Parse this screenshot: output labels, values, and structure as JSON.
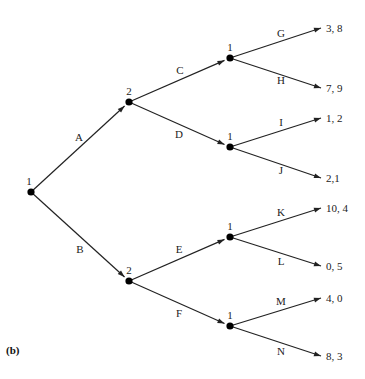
{
  "caption": "(b)",
  "nodes": [
    {
      "id": "root",
      "player": "1"
    },
    {
      "id": "n2a",
      "player": "2"
    },
    {
      "id": "n2b",
      "player": "2"
    },
    {
      "id": "n1a",
      "player": "1"
    },
    {
      "id": "n1b",
      "player": "1"
    },
    {
      "id": "n1c",
      "player": "1"
    },
    {
      "id": "n1d",
      "player": "1"
    }
  ],
  "edges": [
    {
      "from": "root",
      "to": "n2a",
      "label": "A"
    },
    {
      "from": "root",
      "to": "n2b",
      "label": "B"
    },
    {
      "from": "n2a",
      "to": "n1a",
      "label": "C"
    },
    {
      "from": "n2a",
      "to": "n1b",
      "label": "D"
    },
    {
      "from": "n2b",
      "to": "n1c",
      "label": "E"
    },
    {
      "from": "n2b",
      "to": "n1d",
      "label": "F"
    },
    {
      "from": "n1a",
      "to": "t1",
      "label": "G"
    },
    {
      "from": "n1a",
      "to": "t2",
      "label": "H"
    },
    {
      "from": "n1b",
      "to": "t3",
      "label": "I"
    },
    {
      "from": "n1b",
      "to": "t4",
      "label": "J"
    },
    {
      "from": "n1c",
      "to": "t5",
      "label": "K"
    },
    {
      "from": "n1c",
      "to": "t6",
      "label": "L"
    },
    {
      "from": "n1d",
      "to": "t7",
      "label": "M"
    },
    {
      "from": "n1d",
      "to": "t8",
      "label": "N"
    }
  ],
  "terminals": [
    {
      "id": "t1",
      "payoff": "3, 8"
    },
    {
      "id": "t2",
      "payoff": "7, 9"
    },
    {
      "id": "t3",
      "payoff": "1, 2"
    },
    {
      "id": "t4",
      "payoff": "2,1"
    },
    {
      "id": "t5",
      "payoff": "10, 4"
    },
    {
      "id": "t6",
      "payoff": "0, 5"
    },
    {
      "id": "t7",
      "payoff": "4, 0"
    },
    {
      "id": "t8",
      "payoff": "8, 3"
    }
  ]
}
